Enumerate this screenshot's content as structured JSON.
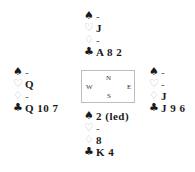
{
  "suits": {
    "spades": "♠",
    "hearts": "♡",
    "diamonds": "♢",
    "clubs": "♣"
  },
  "hands": {
    "north": {
      "spades": "-",
      "hearts": "J",
      "diamonds": "-",
      "clubs": "A 8 2"
    },
    "west": {
      "spades": "-",
      "hearts": "Q",
      "diamonds": "-",
      "clubs": "Q 10 7"
    },
    "east": {
      "spades": "-",
      "hearts": "-",
      "diamonds": "J",
      "clubs": "J 9 6"
    },
    "south": {
      "spades": "2 (led)",
      "hearts": "-",
      "diamonds": "8",
      "clubs": "K 4"
    }
  },
  "compass": {
    "n": "N",
    "s": "S",
    "w": "W",
    "e": "E"
  }
}
